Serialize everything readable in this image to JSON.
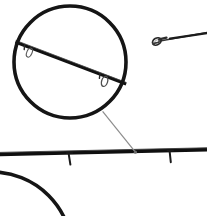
{
  "figure": {
    "background_color": "#ffffff",
    "width": 207,
    "height": 216,
    "alt_text": "Fishing rod shaft shown horizontally with two magnifier circle insets detailing the line guides, and the tapered rod tip with tip-top guide at upper right."
  },
  "colors": {
    "rod_black": "#111111",
    "rod_dark": "#1c1c1c",
    "guide_gray": "#4a4a4a",
    "magnifier_ring": "#151515",
    "leader_line": "#8d8d8d",
    "tip_gray": "#555555",
    "background": "#ffffff"
  },
  "elements": {
    "main_rod_label": "rod blank shaft",
    "rod_tip_label": "rod tip section",
    "tip_top_guide_label": "tip-top guide ring",
    "magnifier_primary_label": "magnified guide detail",
    "magnifier_secondary_label": "second magnified detail",
    "leader_label": "callout leader line",
    "guide_label": "line guide"
  },
  "geometry": {
    "main_rod": {
      "x1": 0,
      "y1": 154,
      "x2": 207,
      "y2": 150,
      "stroke_width": 3.6
    },
    "main_rod_guides": [
      {
        "x": 69,
        "y": 153,
        "height": 11,
        "lean": 2
      },
      {
        "x": 170,
        "y": 151,
        "height": 11,
        "lean": 1
      }
    ],
    "rod_tip": {
      "x1": 158,
      "y1": 41,
      "x2": 207,
      "y2": 33,
      "stroke_width": 2.0
    },
    "tip_top_guide": {
      "cx": 157,
      "cy": 41,
      "rx": 4.4,
      "ry": 3.2,
      "rotate": -28
    },
    "magnifier_primary": {
      "cx": 70,
      "cy": 62,
      "r": 56,
      "stroke_width": 3.4
    },
    "magnifier_primary_rod": {
      "x1": 15,
      "y1": 42,
      "x2": 126,
      "y2": 84,
      "stroke_width": 3.0
    },
    "magnifier_primary_guides": [
      {
        "cx": 29,
        "cy": 52,
        "rx": 3.0,
        "ry": 4.6,
        "rotate": 22
      },
      {
        "cx": 104,
        "cy": 81,
        "rx": 3.4,
        "ry": 5.0,
        "rotate": 20
      }
    ],
    "magnifier_secondary": {
      "cx": -8,
      "cy": 252,
      "r": 80,
      "stroke_width": 3.4
    },
    "leader_line": {
      "x1": 103,
      "y1": 112,
      "x2": 135,
      "y2": 152,
      "stroke_width": 1.2
    }
  }
}
